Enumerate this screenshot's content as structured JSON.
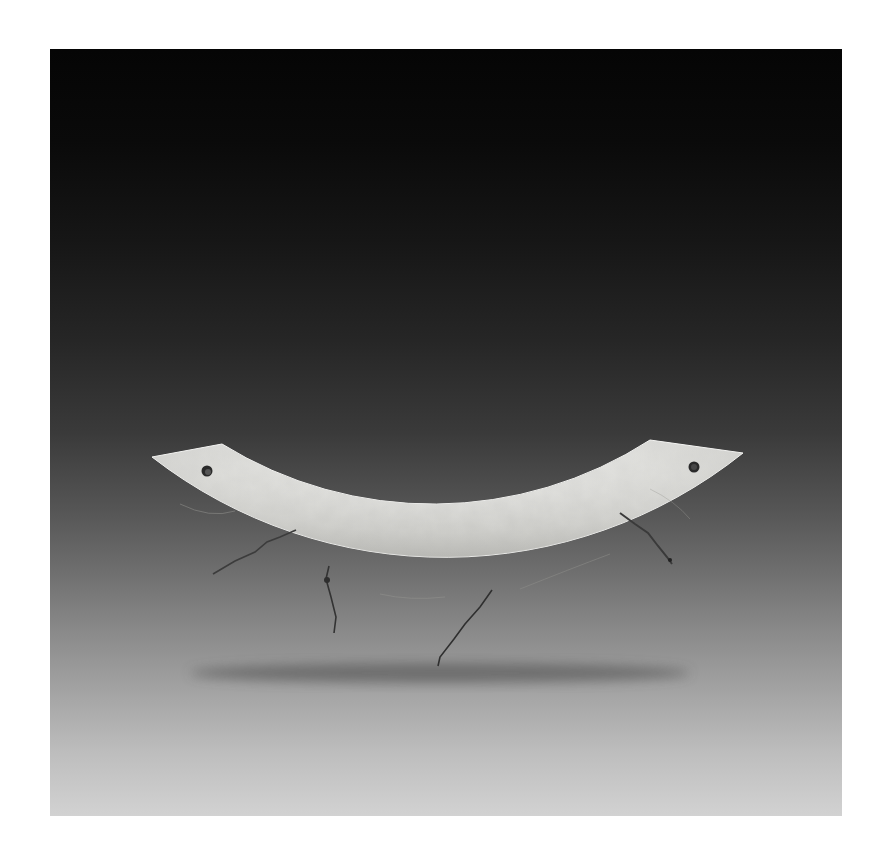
{
  "image": {
    "subject": "Jade huang (arc-shaped pendant) with two drilled suspension holes, broken and rejoined in several pieces",
    "background": "studio gradient from black at top to light grey at bottom",
    "colors": {
      "frame_margin": "#ffffff",
      "background_top": "#050505",
      "background_bottom": "#d2d2d2",
      "jade_light": "#e6e6e3",
      "jade_mid": "#c9c9c5",
      "crack": "#3a3a3a"
    },
    "features": {
      "suspension_holes": 2,
      "visible_cracks": 4
    }
  }
}
